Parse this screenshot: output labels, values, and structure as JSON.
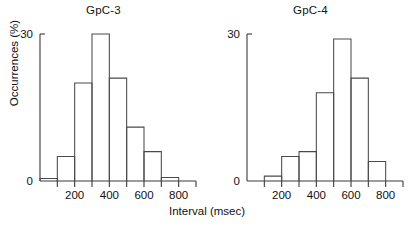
{
  "figure": {
    "xaxis_title": "Interval (msec)",
    "yaxis_title": "Occurrences (%)"
  },
  "chart_data": [
    {
      "type": "bar",
      "title": "GpC-3",
      "xlabel": "Interval (msec)",
      "ylabel": "Occurrences (%)",
      "xlim": [
        0,
        900
      ],
      "ylim": [
        0,
        30
      ],
      "bin_width": 100,
      "grid": false,
      "legend": "none",
      "xticks": [
        0,
        100,
        200,
        300,
        400,
        500,
        600,
        700,
        800,
        900
      ],
      "xtick_labels": [
        "",
        "",
        "200",
        "",
        "400",
        "",
        "600",
        "",
        "800",
        ""
      ],
      "yticks": [
        0,
        30
      ],
      "ytick_labels": [
        "0",
        "30"
      ],
      "bin_starts": [
        0,
        100,
        200,
        300,
        400,
        500,
        600,
        700
      ],
      "categories": [
        "0-100",
        "100-200",
        "200-300",
        "300-400",
        "400-500",
        "500-600",
        "600-700",
        "700-800"
      ],
      "values": [
        0.5,
        5,
        20,
        30,
        21,
        11,
        6,
        0.7
      ]
    },
    {
      "type": "bar",
      "title": "GpC-4",
      "xlabel": "Interval (msec)",
      "ylabel": "Occurrences (%)",
      "xlim": [
        0,
        900
      ],
      "ylim": [
        0,
        30
      ],
      "bin_width": 100,
      "grid": false,
      "legend": "none",
      "xticks": [
        0,
        100,
        200,
        300,
        400,
        500,
        600,
        700,
        800,
        900
      ],
      "xtick_labels": [
        "",
        "",
        "200",
        "",
        "400",
        "",
        "600",
        "",
        "800",
        ""
      ],
      "yticks": [
        0,
        30
      ],
      "ytick_labels": [
        "0",
        "30"
      ],
      "bin_starts": [
        100,
        200,
        300,
        400,
        500,
        600,
        700
      ],
      "categories": [
        "100-200",
        "200-300",
        "300-400",
        "400-500",
        "500-600",
        "600-700",
        "700-800"
      ],
      "values": [
        1,
        5,
        6,
        18,
        29,
        21,
        4
      ]
    }
  ]
}
